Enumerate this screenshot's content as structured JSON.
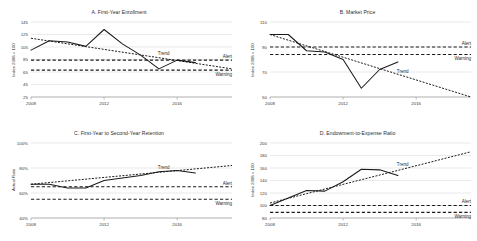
{
  "figure": {
    "panel_count": 4,
    "annotation_labels": {
      "trend": "Trend",
      "alert": "Alert",
      "warning": "Warning"
    }
  },
  "chart_data": [
    {
      "type": "line",
      "panel": "A",
      "title": "A. First-Year Enrollment",
      "xlabel": "",
      "ylabel": "Index 2008 = 100",
      "xlim": [
        2008,
        2019
      ],
      "ylim": [
        25,
        145
      ],
      "yticks": [
        145,
        125,
        105,
        85,
        65,
        45,
        25
      ],
      "xticks": [
        2008,
        2012,
        2016
      ],
      "xtick_labels": [
        "2008",
        "2012",
        "2016"
      ],
      "ytick_labels": [
        "145",
        "125",
        "105",
        "85",
        "65",
        "45",
        "25"
      ],
      "grid": true,
      "legend": "inline-annotations",
      "x": [
        2008,
        2009,
        2010,
        2011,
        2012,
        2013,
        2014,
        2015,
        2016,
        2017
      ],
      "series": [
        {
          "name": "Actual",
          "style": "solid",
          "values": [
            100,
            115,
            113,
            106,
            133,
            110,
            92,
            70,
            84,
            80
          ]
        },
        {
          "name": "Trend",
          "style": "dotted",
          "x": [
            2008,
            2019
          ],
          "values": [
            119,
            70
          ]
        }
      ],
      "reference_lines": [
        {
          "name": "Alert",
          "value": 84,
          "style": "dashed"
        },
        {
          "name": "Warning",
          "value": 68,
          "style": "dashed"
        }
      ]
    },
    {
      "type": "line",
      "panel": "B",
      "title": "B. Market Price",
      "xlabel": "",
      "ylabel": "Index 2008 = 100",
      "xlim": [
        2008,
        2019
      ],
      "ylim": [
        50,
        110
      ],
      "yticks": [
        110,
        90,
        70,
        50
      ],
      "xticks": [
        2008,
        2012,
        2016
      ],
      "xtick_labels": [
        "2008",
        "2012",
        "2016"
      ],
      "ytick_labels": [
        "110",
        "90",
        "70",
        "50"
      ],
      "grid": true,
      "legend": "inline-annotations",
      "x": [
        2008,
        2009,
        2010,
        2011,
        2012,
        2013,
        2014,
        2015
      ],
      "series": [
        {
          "name": "Actual",
          "style": "solid",
          "values": [
            100,
            100,
            87,
            86,
            80,
            57,
            72,
            78
          ]
        },
        {
          "name": "Trend",
          "style": "dotted",
          "x": [
            2008,
            2019
          ],
          "values": [
            100,
            50
          ]
        }
      ],
      "reference_lines": [
        {
          "name": "Alert",
          "value": 90,
          "style": "dashed"
        },
        {
          "name": "Warning",
          "value": 84,
          "style": "dashed"
        }
      ]
    },
    {
      "type": "line",
      "panel": "C",
      "title": "C. First-Year to Second-Year Retention",
      "xlabel": "",
      "ylabel": "Actual Rate",
      "xlim": [
        2008,
        2019
      ],
      "ylim": [
        40,
        100
      ],
      "yticks": [
        100,
        80,
        60,
        40
      ],
      "xticks": [
        2008,
        2012,
        2016
      ],
      "xtick_labels": [
        "2008",
        "2012",
        "2016"
      ],
      "ytick_labels": [
        "100%",
        "80%",
        "60%",
        "40%"
      ],
      "grid": true,
      "legend": "inline-annotations",
      "x": [
        2008,
        2009,
        2010,
        2011,
        2012,
        2013,
        2014,
        2015,
        2016,
        2017
      ],
      "series": [
        {
          "name": "Actual",
          "style": "solid",
          "values": [
            67,
            67,
            64,
            64,
            70,
            72,
            74,
            77,
            78,
            76
          ]
        },
        {
          "name": "Trend",
          "style": "dotted",
          "x": [
            2008,
            2019
          ],
          "values": [
            67,
            82
          ]
        }
      ],
      "reference_lines": [
        {
          "name": "Alert",
          "value": 65,
          "style": "dashed"
        },
        {
          "name": "Warning",
          "value": 55,
          "style": "dashed"
        }
      ]
    },
    {
      "type": "line",
      "panel": "D",
      "title": "D. Endowment-to-Expense Ratio",
      "xlabel": "",
      "ylabel": "Index 2008 = 100",
      "xlim": [
        2008,
        2019
      ],
      "ylim": [
        80,
        200
      ],
      "yticks": [
        200,
        180,
        160,
        140,
        120,
        100,
        80
      ],
      "xticks": [
        2008,
        2012,
        2016
      ],
      "xtick_labels": [
        "2008",
        "2012",
        "2016"
      ],
      "ytick_labels": [
        "200",
        "180",
        "160",
        "140",
        "120",
        "100",
        "80"
      ],
      "grid": true,
      "legend": "inline-annotations",
      "x": [
        2008,
        2009,
        2010,
        2011,
        2012,
        2013,
        2014,
        2015
      ],
      "series": [
        {
          "name": "Actual",
          "style": "solid",
          "values": [
            100,
            112,
            124,
            123,
            138,
            158,
            157,
            148
          ]
        },
        {
          "name": "Trend",
          "style": "dotted",
          "x": [
            2008,
            2019
          ],
          "values": [
            104,
            186
          ]
        }
      ],
      "reference_lines": [
        {
          "name": "Alert",
          "value": 100,
          "style": "dashed"
        },
        {
          "name": "Warning",
          "value": 89,
          "style": "dashed"
        }
      ]
    }
  ]
}
